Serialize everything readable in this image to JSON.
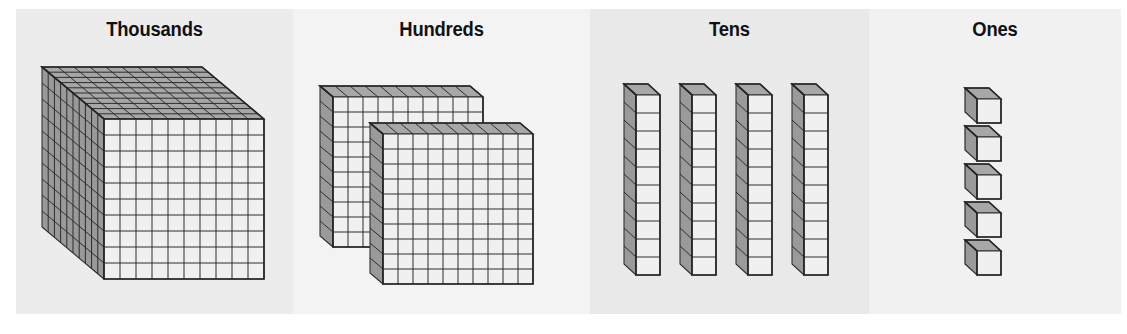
{
  "diagram": {
    "title_visible": false,
    "type": "base-ten-blocks-place-value",
    "background": "#ffffff",
    "panels": [
      {
        "id": "thousands",
        "label": "Thousands",
        "bg": "#ececed",
        "block_shape": "cube",
        "block_count": 1,
        "unit_value": 1000,
        "grid": {
          "cols": 10,
          "rows": 10,
          "depth": 10
        },
        "total_units": 1000
      },
      {
        "id": "hundreds",
        "label": "Hundreds",
        "bg": "#f3f3f4",
        "block_shape": "flat",
        "block_count": 2,
        "unit_value": 100,
        "grid": {
          "cols": 10,
          "rows": 10,
          "depth": 1
        },
        "total_units": 200
      },
      {
        "id": "tens",
        "label": "Tens",
        "bg": "#e9e9ea",
        "block_shape": "rod",
        "block_count": 4,
        "unit_value": 10,
        "grid": {
          "cols": 1,
          "rows": 10,
          "depth": 1
        },
        "total_units": 40
      },
      {
        "id": "ones",
        "label": "Ones",
        "bg": "#f1f1f2",
        "block_shape": "unit-cube",
        "block_count": 5,
        "unit_value": 1,
        "grid": {
          "cols": 1,
          "rows": 1,
          "depth": 1
        },
        "total_units": 5
      }
    ],
    "colors": {
      "face_front": "#efefef",
      "face_top": "#a8a8a8",
      "face_side": "#9d9d9d",
      "edge": "#2c2c2c",
      "title": "#111113"
    }
  }
}
